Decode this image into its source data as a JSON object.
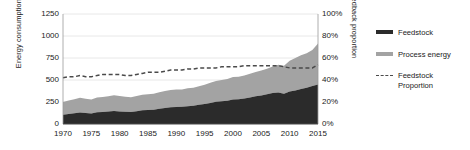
{
  "chart_data": {
    "type": "area",
    "title": "",
    "xlabel": "",
    "ylabel": "Energy consumption (Mtoe)",
    "ylabel_right": "Feedback proportion",
    "xlim": [
      1970,
      2015
    ],
    "ylim": [
      0,
      1250
    ],
    "ylim_right": [
      0,
      100
    ],
    "grid": true,
    "legend_position": "right",
    "yticks": [
      "1250",
      "1000",
      "750",
      "500",
      "250",
      "0"
    ],
    "ytick_values": [
      1250,
      1000,
      750,
      500,
      250,
      0
    ],
    "yticks_right": [
      "100%",
      "80%",
      "60%",
      "40%",
      "20%",
      "0%"
    ],
    "ytick_right_values": [
      100,
      80,
      60,
      40,
      20,
      0
    ],
    "xticks": [
      "1970",
      "1975",
      "1980",
      "1985",
      "1990",
      "1995",
      "2000",
      "2005",
      "2010",
      "2015"
    ],
    "xtick_values": [
      1970,
      1975,
      1980,
      1985,
      1990,
      1995,
      2000,
      2005,
      2010,
      2015
    ],
    "x": [
      1970,
      1971,
      1972,
      1973,
      1974,
      1975,
      1976,
      1977,
      1978,
      1979,
      1980,
      1981,
      1982,
      1983,
      1984,
      1985,
      1986,
      1987,
      1988,
      1989,
      1990,
      1991,
      1992,
      1993,
      1994,
      1995,
      1996,
      1997,
      1998,
      1999,
      2000,
      2001,
      2002,
      2003,
      2004,
      2005,
      2006,
      2007,
      2008,
      2009,
      2010,
      2011,
      2012,
      2013,
      2014,
      2015
    ],
    "series": [
      {
        "name": "Feedstock",
        "color": "#2b2b2b",
        "stack": "total",
        "axis": "left",
        "units": "Mtoe",
        "values": [
          105,
          115,
          122,
          132,
          126,
          120,
          133,
          137,
          142,
          148,
          143,
          139,
          137,
          145,
          155,
          158,
          163,
          172,
          182,
          189,
          192,
          195,
          203,
          208,
          218,
          228,
          240,
          252,
          258,
          265,
          278,
          282,
          290,
          302,
          315,
          325,
          338,
          352,
          358,
          345,
          368,
          382,
          398,
          412,
          432,
          450
        ]
      },
      {
        "name": "Process energy",
        "color": "#a3a3a3",
        "stack": "total",
        "axis": "left",
        "units": "Mtoe",
        "values": [
          145,
          152,
          158,
          166,
          162,
          158,
          168,
          170,
          174,
          180,
          176,
          172,
          168,
          172,
          178,
          180,
          182,
          188,
          194,
          198,
          200,
          198,
          202,
          205,
          212,
          218,
          228,
          238,
          242,
          246,
          255,
          256,
          260,
          268,
          275,
          282,
          290,
          300,
          315,
          318,
          352,
          368,
          382,
          392,
          410,
          465
        ]
      },
      {
        "name": "Feedstock Proportion",
        "color": "#4a4a4a",
        "style": "dashed",
        "axis": "right",
        "units": "%",
        "values": [
          42,
          43,
          43,
          44,
          43,
          43,
          44,
          45,
          45,
          45,
          45,
          44,
          44,
          45,
          46,
          47,
          47,
          47,
          48,
          49,
          49,
          49,
          50,
          50,
          51,
          51,
          51,
          51,
          52,
          52,
          52,
          52,
          53,
          53,
          53,
          53,
          53,
          53,
          53,
          52,
          51,
          51,
          51,
          51,
          51,
          54
        ]
      }
    ]
  },
  "legend": {
    "items": [
      {
        "label": "Feedstock",
        "swatch": "dark"
      },
      {
        "label": "Process energy",
        "swatch": "gray"
      },
      {
        "label": "Feedstock\nProportion",
        "swatch": "dashed"
      }
    ]
  }
}
